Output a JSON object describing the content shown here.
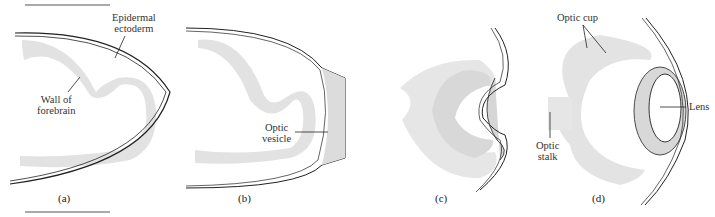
{
  "figure": {
    "panels": [
      {
        "id": "a",
        "label": "(a)",
        "annotations": [
          "Epidermal ectoderm",
          "Wall of forebrain"
        ]
      },
      {
        "id": "b",
        "label": "(b)",
        "annotations": [
          "Optic vesicle"
        ]
      },
      {
        "id": "c",
        "label": "(c)",
        "annotations": []
      },
      {
        "id": "d",
        "label": "(d)",
        "annotations": [
          "Optic cup",
          "Lens",
          "Optic stalk"
        ]
      }
    ],
    "labels": {
      "epidermal_1": "Epidermal",
      "epidermal_2": "ectoderm",
      "wall_1": "Wall of",
      "wall_2": "forebrain",
      "vesicle_1": "Optic",
      "vesicle_2": "vesicle",
      "optic_cup": "Optic cup",
      "lens": "Lens",
      "stalk_1": "Optic",
      "stalk_2": "stalk"
    },
    "colors": {
      "tissue": "#e4e4e4",
      "tissue_dark": "#d6d6d6",
      "outline": "#222222"
    }
  }
}
